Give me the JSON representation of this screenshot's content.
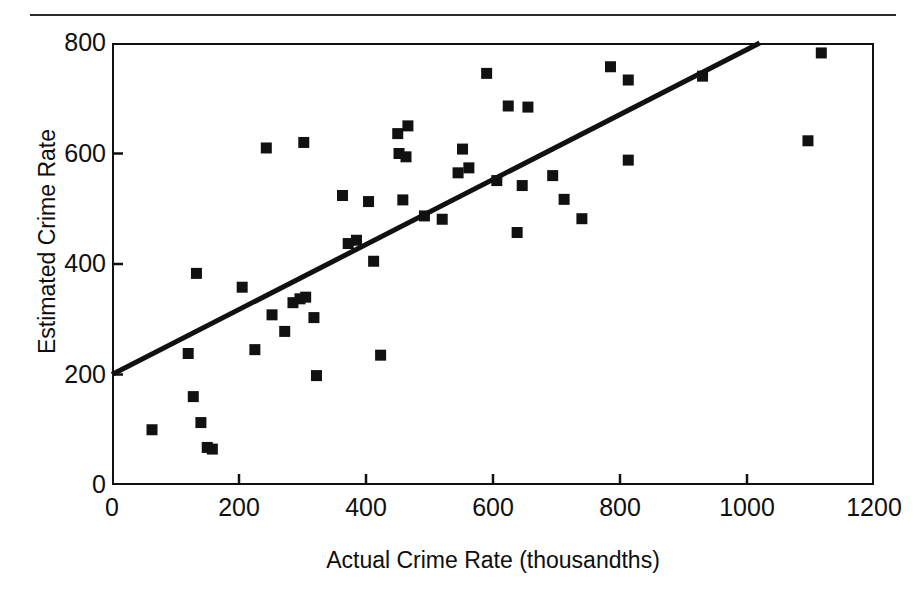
{
  "figure": {
    "top_caption_fragment": "",
    "has_horizontal_rule": true
  },
  "chart_data": {
    "type": "scatter",
    "title": "",
    "xlabel": "Actual Crime Rate (thousandths)",
    "ylabel": "Estimated Crime Rate",
    "xlim": [
      0,
      1200
    ],
    "ylim": [
      0,
      800
    ],
    "xticks": [
      0,
      200,
      400,
      600,
      800,
      1000,
      1200
    ],
    "yticks": [
      0,
      200,
      400,
      600,
      800
    ],
    "xtick_labels": [
      "0",
      "200",
      "400",
      "600",
      "800",
      "1000",
      "1200"
    ],
    "ytick_labels": [
      "0",
      "200",
      "400",
      "600",
      "800"
    ],
    "grid": false,
    "legend": null,
    "marker": {
      "shape": "square",
      "color": "#111111",
      "size_px": 11
    },
    "trendline": {
      "type": "linear",
      "color": "#111111",
      "width_px": 5,
      "intercept": 200,
      "slope": 0.588,
      "x_start": 0,
      "y_start": 200,
      "x_end": 1020,
      "y_end": 800,
      "label": "regression line"
    },
    "points": [
      {
        "x": 63,
        "y": 100
      },
      {
        "x": 120,
        "y": 238
      },
      {
        "x": 128,
        "y": 160
      },
      {
        "x": 133,
        "y": 383
      },
      {
        "x": 140,
        "y": 113
      },
      {
        "x": 150,
        "y": 68
      },
      {
        "x": 158,
        "y": 65
      },
      {
        "x": 205,
        "y": 358
      },
      {
        "x": 225,
        "y": 245
      },
      {
        "x": 243,
        "y": 610
      },
      {
        "x": 252,
        "y": 308
      },
      {
        "x": 272,
        "y": 278
      },
      {
        "x": 285,
        "y": 330
      },
      {
        "x": 296,
        "y": 337
      },
      {
        "x": 302,
        "y": 620
      },
      {
        "x": 305,
        "y": 340
      },
      {
        "x": 318,
        "y": 303
      },
      {
        "x": 322,
        "y": 198
      },
      {
        "x": 363,
        "y": 524
      },
      {
        "x": 372,
        "y": 437
      },
      {
        "x": 385,
        "y": 443
      },
      {
        "x": 404,
        "y": 513
      },
      {
        "x": 412,
        "y": 405
      },
      {
        "x": 423,
        "y": 235
      },
      {
        "x": 450,
        "y": 636
      },
      {
        "x": 452,
        "y": 600
      },
      {
        "x": 458,
        "y": 516
      },
      {
        "x": 463,
        "y": 594
      },
      {
        "x": 466,
        "y": 650
      },
      {
        "x": 492,
        "y": 487
      },
      {
        "x": 520,
        "y": 481
      },
      {
        "x": 545,
        "y": 565
      },
      {
        "x": 552,
        "y": 608
      },
      {
        "x": 562,
        "y": 574
      },
      {
        "x": 590,
        "y": 745
      },
      {
        "x": 606,
        "y": 551
      },
      {
        "x": 624,
        "y": 686
      },
      {
        "x": 638,
        "y": 457
      },
      {
        "x": 646,
        "y": 542
      },
      {
        "x": 655,
        "y": 684
      },
      {
        "x": 694,
        "y": 560
      },
      {
        "x": 712,
        "y": 517
      },
      {
        "x": 740,
        "y": 482
      },
      {
        "x": 785,
        "y": 757
      },
      {
        "x": 813,
        "y": 733
      },
      {
        "x": 813,
        "y": 588
      },
      {
        "x": 930,
        "y": 740
      },
      {
        "x": 1096,
        "y": 623
      },
      {
        "x": 1117,
        "y": 782
      }
    ]
  }
}
